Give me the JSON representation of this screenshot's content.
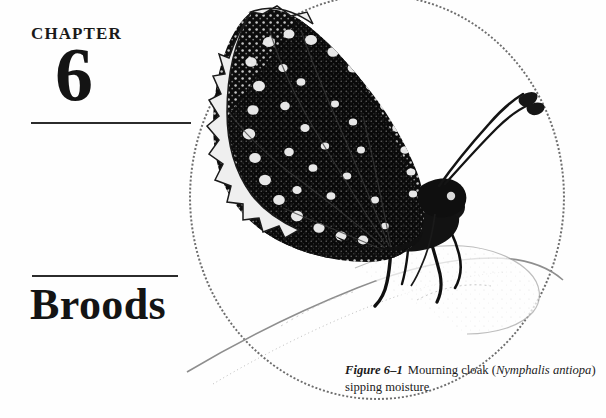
{
  "page": {
    "background_color": "#fefefe",
    "ink_color": "#141414",
    "rule_color": "#2b2b2b",
    "vignette_color": "#6d6d6d"
  },
  "chapter": {
    "label": "CHAPTER",
    "number": "6",
    "title": "Broods"
  },
  "figure": {
    "label": "Figure 6–1",
    "text_before_italic": "Mourning cloak (",
    "species_italic": "Nymphalis antiopa",
    "text_after_italic": ") sipping moisture",
    "full_caption": "Figure 6–1  Mourning cloak (Nymphalis antiopa) sipping moisture"
  },
  "illustration": {
    "style": "stippled halftone engraving",
    "wing_fill": "#111111",
    "spot_fill": "#f2f2f2",
    "stone_outline": "#9a9a9a",
    "elements": [
      "upper-wing",
      "lower-wing",
      "ragged-wing-margin",
      "pale-spot-band",
      "thorax",
      "abdomen",
      "antenna-left",
      "antenna-right",
      "foreleg",
      "midleg",
      "hindleg",
      "stone-surface"
    ]
  }
}
